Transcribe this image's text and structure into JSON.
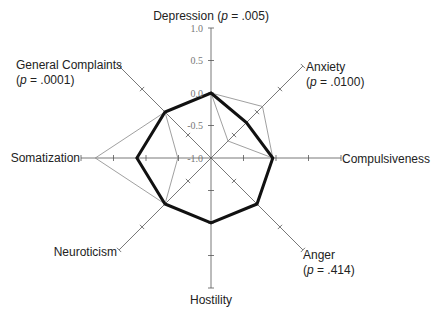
{
  "chart_data": {
    "type": "radar",
    "title": "",
    "axes": [
      {
        "name": "Depression",
        "p_label": "(p = .005)",
        "label_inline": true
      },
      {
        "name": "Anxiety",
        "p_label": "(p = .0100)"
      },
      {
        "name": "Compulsiveness",
        "p_label": ""
      },
      {
        "name": "Anger",
        "p_label": "(p = .414)"
      },
      {
        "name": "Hostility",
        "p_label": ""
      },
      {
        "name": "Neuroticism",
        "p_label": ""
      },
      {
        "name": "Somatization",
        "p_label": ""
      },
      {
        "name": "General Complaints",
        "p_label": "(p = .0001)"
      }
    ],
    "categories": [
      "Depression",
      "Anxiety",
      "Compulsiveness",
      "Anger",
      "Hostility",
      "Neuroticism",
      "Somatization",
      "General Complaints"
    ],
    "radial_range": [
      -1.0,
      1.0
    ],
    "radial_ticks": [
      -1.0,
      -0.5,
      0.0,
      0.5,
      1.0
    ],
    "radial_tick_labels": [
      "-1.0",
      "-0.5",
      "0.0",
      "0.5",
      "1.0"
    ],
    "series": [
      {
        "name": "Series A (outer thin)",
        "style": "thin",
        "values": [
          0.0,
          0.12,
          -0.05,
          0.0,
          0.0,
          0.0,
          0.78,
          0.0
        ]
      },
      {
        "name": "Series B (inner thin)",
        "style": "thin",
        "values": [
          0.0,
          -0.63,
          -0.05,
          0.0,
          0.0,
          0.0,
          -0.49,
          0.0
        ]
      },
      {
        "name": "Series C (bold)",
        "style": "bold",
        "values": [
          0.0,
          -0.23,
          -0.05,
          0.0,
          0.0,
          0.0,
          0.14,
          0.0
        ]
      }
    ],
    "grid": false,
    "legend": null
  },
  "labels": {
    "depression": "Depression (p = .005)",
    "depression_name": "Depression (",
    "depression_p": "p",
    "depression_rest": " = .005)",
    "anxiety_name": "Anxiety",
    "anxiety_p_open": "(",
    "anxiety_p": "p",
    "anxiety_p_rest": " = .0100)",
    "compulsiveness": "Compulsiveness",
    "anger_name": "Anger",
    "anger_p_open": "(",
    "anger_p": "p",
    "anger_p_rest": " = .414)",
    "hostility": "Hostility",
    "neuroticism": "Neuroticism",
    "somatization": "Somatization",
    "general_name": "General Complaints",
    "general_p_open": "(",
    "general_p": "p",
    "general_p_rest": " = .0001)"
  },
  "ticks": {
    "t1": "1.0",
    "t05": "0.5",
    "t0": "0.0",
    "tm05": "-0.5",
    "tm1": "-1.0"
  }
}
